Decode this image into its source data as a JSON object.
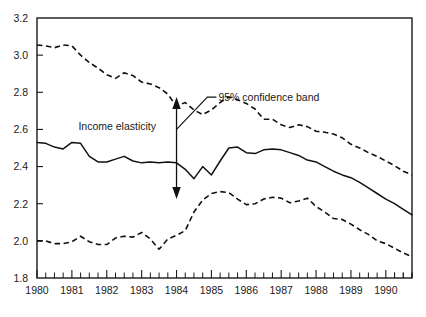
{
  "chart_data": {
    "type": "line",
    "title": "",
    "subtitle": "",
    "xlabel": "",
    "ylabel": "",
    "xlim": [
      1980.0,
      1990.75
    ],
    "ylim": [
      1.8,
      3.2
    ],
    "grid": false,
    "legend_position": "none",
    "y_ticks": [
      "3.2",
      "3.0",
      "2.8",
      "2.6",
      "2.4",
      "2.2",
      "2.0",
      "1.8"
    ],
    "y_tick_values": [
      3.2,
      3.0,
      2.8,
      2.6,
      2.4,
      2.2,
      2.0,
      1.8
    ],
    "x_tick_labels": [
      "1980",
      "1981",
      "1982",
      "1983",
      "1984",
      "1985",
      "1986",
      "1987",
      "1988",
      "1989",
      "1990"
    ],
    "x_tick_values": [
      1980,
      1981,
      1982,
      1983,
      1984,
      1985,
      1986,
      1987,
      1988,
      1989,
      1990
    ],
    "x_minor_ticks_per_year": 4,
    "series": [
      {
        "name": "95% confidence band upper",
        "style": "dashed",
        "color": "#111111",
        "x": [
          1980.0,
          1980.25,
          1980.5,
          1980.75,
          1981.0,
          1981.25,
          1981.5,
          1981.75,
          1982.0,
          1982.25,
          1982.5,
          1982.75,
          1983.0,
          1983.25,
          1983.5,
          1983.75,
          1984.0,
          1984.25,
          1984.5,
          1984.75,
          1985.0,
          1985.25,
          1985.5,
          1985.75,
          1986.0,
          1986.25,
          1986.5,
          1986.75,
          1987.0,
          1987.25,
          1987.5,
          1987.75,
          1988.0,
          1988.25,
          1988.5,
          1988.75,
          1989.0,
          1989.25,
          1989.5,
          1989.75,
          1990.0,
          1990.25,
          1990.5,
          1990.75
        ],
        "y": [
          3.055,
          3.05,
          3.04,
          3.055,
          3.05,
          3.0,
          2.96,
          2.93,
          2.895,
          2.875,
          2.905,
          2.89,
          2.855,
          2.845,
          2.825,
          2.79,
          2.725,
          2.745,
          2.705,
          2.68,
          2.705,
          2.745,
          2.775,
          2.76,
          2.74,
          2.71,
          2.655,
          2.655,
          2.625,
          2.61,
          2.625,
          2.615,
          2.59,
          2.585,
          2.575,
          2.555,
          2.52,
          2.5,
          2.475,
          2.455,
          2.43,
          2.405,
          2.375,
          2.355
        ]
      },
      {
        "name": "Income elasticity",
        "style": "solid",
        "color": "#111111",
        "x": [
          1980.0,
          1980.25,
          1980.5,
          1980.75,
          1981.0,
          1981.25,
          1981.5,
          1981.75,
          1982.0,
          1982.25,
          1982.5,
          1982.75,
          1983.0,
          1983.25,
          1983.5,
          1983.75,
          1984.0,
          1984.25,
          1984.5,
          1984.75,
          1985.0,
          1985.25,
          1985.5,
          1985.75,
          1986.0,
          1986.25,
          1986.5,
          1986.75,
          1987.0,
          1987.25,
          1987.5,
          1987.75,
          1988.0,
          1988.25,
          1988.5,
          1988.75,
          1989.0,
          1989.25,
          1989.5,
          1989.75,
          1990.0,
          1990.25,
          1990.5,
          1990.75
        ],
        "y": [
          2.53,
          2.525,
          2.505,
          2.495,
          2.53,
          2.525,
          2.455,
          2.425,
          2.425,
          2.44,
          2.455,
          2.43,
          2.42,
          2.425,
          2.42,
          2.425,
          2.42,
          2.385,
          2.335,
          2.4,
          2.355,
          2.43,
          2.5,
          2.505,
          2.475,
          2.47,
          2.49,
          2.495,
          2.49,
          2.475,
          2.46,
          2.435,
          2.425,
          2.4,
          2.375,
          2.355,
          2.34,
          2.315,
          2.285,
          2.255,
          2.225,
          2.2,
          2.17,
          2.14
        ]
      },
      {
        "name": "95% confidence band lower",
        "style": "dashed",
        "color": "#111111",
        "x": [
          1980.0,
          1980.25,
          1980.5,
          1980.75,
          1981.0,
          1981.25,
          1981.5,
          1981.75,
          1982.0,
          1982.25,
          1982.5,
          1982.75,
          1983.0,
          1983.25,
          1983.5,
          1983.75,
          1984.0,
          1984.25,
          1984.5,
          1984.75,
          1985.0,
          1985.25,
          1985.5,
          1985.75,
          1986.0,
          1986.25,
          1986.5,
          1986.75,
          1987.0,
          1987.25,
          1987.5,
          1987.75,
          1988.0,
          1988.25,
          1988.5,
          1988.75,
          1989.0,
          1989.25,
          1989.5,
          1989.75,
          1990.0,
          1990.25,
          1990.5,
          1990.75
        ],
        "y": [
          2.0,
          2.0,
          1.985,
          1.985,
          1.995,
          2.025,
          1.995,
          1.98,
          1.98,
          2.015,
          2.025,
          2.02,
          2.045,
          2.01,
          1.955,
          2.01,
          2.03,
          2.055,
          2.155,
          2.22,
          2.255,
          2.265,
          2.26,
          2.225,
          2.195,
          2.2,
          2.225,
          2.235,
          2.23,
          2.205,
          2.215,
          2.23,
          2.185,
          2.155,
          2.12,
          2.115,
          2.09,
          2.06,
          2.035,
          2.0,
          1.985,
          1.96,
          1.935,
          1.915
        ]
      }
    ],
    "annotations": [
      {
        "name": "income-elasticity-label",
        "text": "Income elasticity",
        "x": 1982.3,
        "y": 2.595
      },
      {
        "name": "confidence-band-label",
        "text": "95% confidence band",
        "x": 1985.2,
        "y": 2.755
      },
      {
        "name": "confidence-band-arrow",
        "text": "",
        "x": 1984.0,
        "y_top": 2.775,
        "y_bottom": 2.225
      }
    ]
  }
}
